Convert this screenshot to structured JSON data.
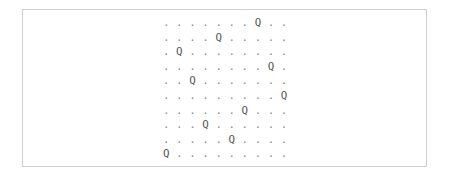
{
  "puzzle": {
    "size": 10,
    "empty_symbol": ".",
    "queen_symbol": "Q",
    "queen_columns": [
      7,
      4,
      1,
      8,
      2,
      9,
      6,
      3,
      5,
      0
    ],
    "rows": [
      ". . . . . . . Q . .",
      ". . . . Q . . . . .",
      ". Q . . . . . . . .",
      ". . . . . . . . Q .",
      ". . Q . . . . . . .",
      ". . . . . . . . . Q",
      ". . . . . . Q . . .",
      ". . . Q . . . . . .",
      ". . . . . Q . . . .",
      "Q . . . . . . . . ."
    ]
  },
  "colors": {
    "border": "#cfcfcf",
    "text": "#555555",
    "dot": "#8a8a8a",
    "background": "#ffffff"
  }
}
